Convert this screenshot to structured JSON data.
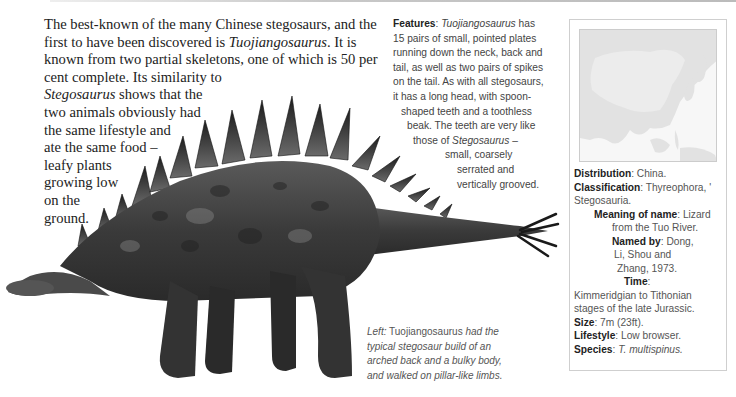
{
  "intro": {
    "lines": [
      [
        "The best-known of the many Chinese stegosaurs, and the",
        ""
      ],
      [
        "first to have been discovered  is ",
        "Tuojiangosaurus",
        ". It is"
      ],
      [
        "known from two partial skeletons, one of which is 50 per"
      ],
      [
        "cent complete. Its similarity to"
      ],
      [
        "Stegosaurus",
        " shows that the"
      ],
      [
        "two animals obviously had"
      ],
      [
        "the same lifestyle and"
      ],
      [
        "ate the same food –"
      ],
      [
        "leafy plants"
      ],
      [
        "growing low"
      ],
      [
        "on the"
      ],
      [
        "ground."
      ]
    ],
    "l1": "The best-known of the many Chinese stegosaurs, and the",
    "l2a": "first to have been discovered  is ",
    "l2i": "Tuojiangosaurus",
    "l2b": ". It is",
    "l3": "known from two partial skeletons, one of which is 50 per",
    "l4": "cent complete. Its similarity to",
    "l5i": "Stegosaurus",
    "l5b": " shows that the",
    "l6": "two animals obviously had",
    "l7": "the same lifestyle and",
    "l8": "ate the same food –",
    "l9": "leafy plants",
    "l10": "growing low",
    "l11": "on the",
    "l12": "ground."
  },
  "features": {
    "label": "Features",
    "l1i": "Tuojiangosaurus",
    "l1b": " has",
    "l2": "15 pairs of small, pointed plates",
    "l3": "running down the neck, back and",
    "l4": "tail, as well as two pairs of spikes",
    "l5": "on the tail. As with all stegosaurs,",
    "l6": "it has a long head, with spoon-",
    "l7": "shaped teeth and a toothless",
    "l8": "beak. The teeth are very like",
    "l9a": "those of ",
    "l9i": "Stegosaurus",
    "l9b": " –",
    "l10": "small, coarsely",
    "l11": "serrated and",
    "l12": "vertically grooved."
  },
  "caption": {
    "l1a": "Left:",
    "l1n": " Tuojiangosaurus",
    "l1b": " had the",
    "l2": "typical stegosaur build of an",
    "l3": "arched back and a bulky body,",
    "l4": "and walked on pillar-like limbs."
  },
  "factbox": {
    "map_region": "East Asia (China highlighted)",
    "distribution_label": "Distribution",
    "distribution": "China.",
    "classification_label": "Classification",
    "classification_a": "Thyreophora, '",
    "classification_b": "Stegosauria.",
    "meaning_label": "Meaning of name",
    "meaning_a": "Lizard",
    "meaning_b": "from the Tuo River.",
    "named_label": "Named by",
    "named_a": "Dong,",
    "named_b": "Li, Shou and",
    "named_c": "Zhang, 1973.",
    "time_label": "Time",
    "time_a": "Kimmeridgian to Tithonian",
    "time_b": "stages of the late Jurassic.",
    "size_label": "Size",
    "size": "7m (23ft).",
    "lifestyle_label": "Lifestyle",
    "lifestyle": "Low browser.",
    "species_label": "Species",
    "species": "T. multispinus."
  },
  "colors": {
    "body_text": "#222222",
    "sans_text": "#555555",
    "rule": "#c8c8c8",
    "map_land": "#e2e2e2",
    "map_china": "#ececec",
    "map_sea": "#f7f7f7"
  }
}
